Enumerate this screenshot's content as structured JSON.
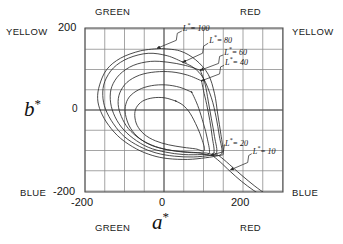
{
  "figure": {
    "title": "",
    "axis_titles": {
      "x": "a",
      "x_star": "*",
      "y": "b",
      "y_star": "*"
    },
    "corner_labels": {
      "top_left_outer": "YELLOW",
      "top_left_inner": "GREEN",
      "top_right_inner": "RED",
      "top_right_outer": "YELLOW",
      "bottom_left_outer": "BLUE",
      "bottom_left_inner": "GREEN",
      "bottom_right_inner": "RED",
      "bottom_right_outer": "BLUE"
    },
    "x_ticks": [
      {
        "value": -200,
        "label": "-200"
      },
      {
        "value": 0,
        "label": "0"
      },
      {
        "value": 200,
        "label": "200"
      }
    ],
    "y_ticks": [
      {
        "value": 200,
        "label": "200"
      },
      {
        "value": 0,
        "label": "0"
      },
      {
        "value": -200,
        "label": "-200"
      }
    ],
    "colors": {
      "background": "#ffffff",
      "grid": "#8e8e8e",
      "axis": "#555555",
      "curve": "#2b2b2b",
      "text": "#141414"
    }
  },
  "chart_data": {
    "type": "line",
    "title": "",
    "xlabel": "a*",
    "ylabel": "b*",
    "xlim": [
      -215,
      300
    ],
    "ylim": [
      -220,
      218
    ],
    "grid": true,
    "legend": "inline-annotations",
    "grid_step": 50,
    "annotations": [
      {
        "text": "L* = 100",
        "label_x": 45,
        "label_y": 195,
        "point_x": -18,
        "point_y": 152
      },
      {
        "text": "L* = 80",
        "label_x": 112,
        "label_y": 165,
        "point_x": 48,
        "point_y": 118
      },
      {
        "text": "L* = 60",
        "label_x": 150,
        "label_y": 136,
        "point_x": 92,
        "point_y": 98
      },
      {
        "text": "L* = 40",
        "label_x": 152,
        "label_y": 110,
        "point_x": 95,
        "point_y": 72
      },
      {
        "text": "L* = 20",
        "label_x": 152,
        "label_y": -88,
        "point_x": 118,
        "point_y": -112
      },
      {
        "text": "L* = 10",
        "label_x": 222,
        "label_y": -108,
        "point_x": 168,
        "point_y": -148
      }
    ],
    "series": [
      {
        "name": "L* = 100",
        "L": 100,
        "points": [
          [
            -10,
            152
          ],
          [
            -60,
            146
          ],
          [
            -110,
            128
          ],
          [
            -145,
            100
          ],
          [
            -163,
            62
          ],
          [
            -168,
            28
          ],
          [
            -160,
            -4
          ],
          [
            -140,
            -38
          ],
          [
            -110,
            -70
          ],
          [
            -70,
            -96
          ],
          [
            -30,
            -112
          ],
          [
            10,
            -120
          ],
          [
            60,
            -122
          ],
          [
            105,
            -118
          ],
          [
            140,
            -112
          ],
          [
            150,
            -106
          ],
          [
            144,
            -60
          ],
          [
            136,
            -10
          ],
          [
            128,
            40
          ],
          [
            112,
            88
          ],
          [
            80,
            124
          ],
          [
            40,
            146
          ],
          [
            -10,
            152
          ]
        ]
      },
      {
        "name": "L* = 80",
        "L": 80,
        "points": [
          [
            48,
            118
          ],
          [
            8,
            134
          ],
          [
            -40,
            140
          ],
          [
            -90,
            128
          ],
          [
            -128,
            104
          ],
          [
            -150,
            70
          ],
          [
            -155,
            36
          ],
          [
            -148,
            2
          ],
          [
            -128,
            -34
          ],
          [
            -100,
            -66
          ],
          [
            -62,
            -90
          ],
          [
            -20,
            -106
          ],
          [
            26,
            -114
          ],
          [
            74,
            -116
          ],
          [
            118,
            -112
          ],
          [
            146,
            -108
          ],
          [
            140,
            -64
          ],
          [
            132,
            -18
          ],
          [
            120,
            30
          ],
          [
            100,
            78
          ],
          [
            76,
            104
          ],
          [
            48,
            118
          ]
        ]
      },
      {
        "name": "L* = 60",
        "L": 60,
        "points": [
          [
            92,
            98
          ],
          [
            54,
            110
          ],
          [
            10,
            118
          ],
          [
            -34,
            120
          ],
          [
            -78,
            110
          ],
          [
            -112,
            88
          ],
          [
            -132,
            58
          ],
          [
            -136,
            26
          ],
          [
            -128,
            -8
          ],
          [
            -108,
            -42
          ],
          [
            -78,
            -70
          ],
          [
            -40,
            -92
          ],
          [
            4,
            -104
          ],
          [
            50,
            -110
          ],
          [
            96,
            -110
          ],
          [
            132,
            -108
          ],
          [
            128,
            -66
          ],
          [
            120,
            -22
          ],
          [
            112,
            22
          ],
          [
            104,
            64
          ],
          [
            92,
            98
          ]
        ]
      },
      {
        "name": "L* = 40",
        "L": 40,
        "points": [
          [
            95,
            72
          ],
          [
            60,
            86
          ],
          [
            20,
            94
          ],
          [
            -22,
            94
          ],
          [
            -62,
            86
          ],
          [
            -94,
            68
          ],
          [
            -112,
            42
          ],
          [
            -116,
            14
          ],
          [
            -108,
            -16
          ],
          [
            -90,
            -46
          ],
          [
            -60,
            -72
          ],
          [
            -22,
            -90
          ],
          [
            20,
            -100
          ],
          [
            64,
            -104
          ],
          [
            104,
            -106
          ],
          [
            126,
            -106
          ],
          [
            122,
            -66
          ],
          [
            116,
            -26
          ],
          [
            108,
            14
          ],
          [
            100,
            48
          ],
          [
            95,
            72
          ]
        ]
      },
      {
        "name": "L* = 20",
        "L": 20,
        "points": [
          [
            70,
            44
          ],
          [
            40,
            56
          ],
          [
            4,
            62
          ],
          [
            -32,
            60
          ],
          [
            -64,
            50
          ],
          [
            -88,
            32
          ],
          [
            -98,
            8
          ],
          [
            -96,
            -18
          ],
          [
            -84,
            -46
          ],
          [
            -62,
            -70
          ],
          [
            -30,
            -88
          ],
          [
            8,
            -98
          ],
          [
            50,
            -104
          ],
          [
            88,
            -106
          ],
          [
            114,
            -108
          ],
          [
            110,
            -72
          ],
          [
            100,
            -34
          ],
          [
            88,
            4
          ],
          [
            78,
            28
          ],
          [
            70,
            44
          ]
        ]
      },
      {
        "name": "L* = 20 inner",
        "L": 20,
        "points": [
          [
            30,
            22
          ],
          [
            2,
            30
          ],
          [
            -28,
            30
          ],
          [
            -54,
            22
          ],
          [
            -70,
            6
          ],
          [
            -74,
            -14
          ],
          [
            -68,
            -38
          ],
          [
            -50,
            -60
          ],
          [
            -22,
            -76
          ],
          [
            12,
            -86
          ],
          [
            48,
            -92
          ],
          [
            80,
            -96
          ],
          [
            102,
            -100
          ],
          [
            96,
            -72
          ],
          [
            84,
            -42
          ],
          [
            66,
            -8
          ],
          [
            48,
            12
          ],
          [
            30,
            22
          ]
        ]
      },
      {
        "name": "L* = 10 tail",
        "L": 10,
        "open": true,
        "points": [
          [
            128,
            -106
          ],
          [
            146,
            -118
          ],
          [
            172,
            -140
          ],
          [
            200,
            -164
          ],
          [
            230,
            -188
          ],
          [
            258,
            -208
          ],
          [
            272,
            -218
          ]
        ]
      },
      {
        "name": "L* = 10 tail lower",
        "L": 10,
        "open": true,
        "points": [
          [
            122,
            -112
          ],
          [
            142,
            -128
          ],
          [
            168,
            -152
          ],
          [
            196,
            -176
          ],
          [
            226,
            -198
          ],
          [
            252,
            -214
          ],
          [
            266,
            -220
          ]
        ]
      }
    ]
  }
}
